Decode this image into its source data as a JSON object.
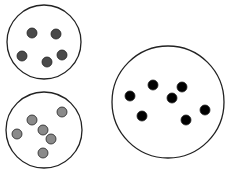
{
  "diagram": {
    "containers": [
      {
        "id": "container-top-left",
        "cx": 44,
        "cy": 42,
        "r": 37,
        "particle_color": "#4a4a4a",
        "particles": [
          [
            32,
            33
          ],
          [
            56,
            34
          ],
          [
            22,
            56
          ],
          [
            47,
            62
          ],
          [
            62,
            55
          ]
        ]
      },
      {
        "id": "container-bottom-left",
        "cx": 44,
        "cy": 130,
        "r": 38,
        "particle_color": "#8a8a8a",
        "particles": [
          [
            62,
            112
          ],
          [
            32,
            120
          ],
          [
            43,
            130
          ],
          [
            17,
            134
          ],
          [
            51,
            139
          ],
          [
            43,
            153
          ]
        ]
      },
      {
        "id": "container-right",
        "cx": 168,
        "cy": 102,
        "r": 56,
        "particle_color": "#000000",
        "particles": [
          [
            153,
            85
          ],
          [
            182,
            87
          ],
          [
            130,
            96
          ],
          [
            172,
            98
          ],
          [
            142,
            116
          ],
          [
            186,
            120
          ],
          [
            205,
            110
          ]
        ]
      }
    ],
    "particle_radius": 5,
    "stroke_color": "#222222"
  }
}
